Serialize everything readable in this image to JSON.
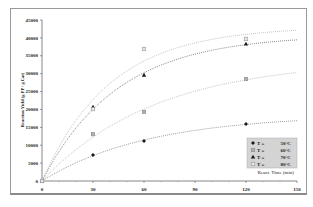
{
  "chart_data": {
    "type": "scatter",
    "title": "",
    "xlabel": "React. Time (min)",
    "ylabel": "Reaction Yield (g PP / g Cat)",
    "xlim": [
      0,
      150
    ],
    "ylim": [
      0,
      45000
    ],
    "x_ticks": [
      0,
      30,
      60,
      90,
      120,
      150
    ],
    "x_tick_labels": [
      "0",
      "30",
      "60",
      "90",
      "120",
      "150"
    ],
    "y_ticks": [
      0,
      5000,
      10000,
      15000,
      20000,
      25000,
      30000,
      35000,
      40000,
      45000
    ],
    "y_tick_labels": [
      "0",
      "5000",
      "10000",
      "15000",
      "20000",
      "25000",
      "30000",
      "35000",
      "40000",
      "45000"
    ],
    "grid": false,
    "legend_position": "lower right (inside, above x-axis title)",
    "x": [
      0,
      30,
      60,
      120
    ],
    "series": [
      {
        "name": "T = 50°C",
        "marker": "diamond",
        "color": "#1a1a1a",
        "values": [
          0,
          7300,
          11200,
          15900
        ],
        "trend": "dotted"
      },
      {
        "name": "T = 60°C",
        "marker": "square-gray",
        "color": "#8c8c8c",
        "values": [
          0,
          13100,
          19300,
          28500
        ],
        "trend": "dotted"
      },
      {
        "name": "T = 70°C",
        "marker": "triangle",
        "color": "#1a1a1a",
        "values": [
          0,
          20700,
          29600,
          38300
        ],
        "trend": "dotted"
      },
      {
        "name": "T = 80°C",
        "marker": "square-open",
        "color": "#9a9a9a",
        "values": [
          0,
          20100,
          36900,
          39700
        ],
        "trend": "dotted"
      }
    ]
  },
  "legend": {
    "items": [
      {
        "symbol": "◆",
        "prefix": "T =",
        "value": "50°C"
      },
      {
        "symbol": "▩",
        "prefix": "T =",
        "value": "60°C"
      },
      {
        "symbol": "▲",
        "prefix": "T =",
        "value": "70°C"
      },
      {
        "symbol": "□",
        "prefix": "T =",
        "value": "80°C"
      }
    ]
  }
}
